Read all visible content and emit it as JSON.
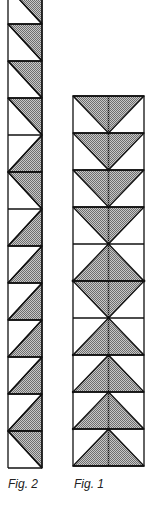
{
  "figures": {
    "fig2": {
      "caption": "Fig. 2",
      "description": "Single column strip of half-square triangle blocks (diagonal splits), partially cropped at top",
      "rows_top_to_bottom": [
        "diag-tl-br shaded-upper-right (cropped)",
        "diag-tl-br shaded-upper-right",
        "diag-tl-br shaded-upper-right",
        "diag-tl-br shaded-upper-right",
        "diag-tr-bl shaded-lower-right",
        "diag-tl-br shaded-upper-right",
        "diag-tr-bl shaded-lower-right",
        "diag-tr-bl shaded-lower-right",
        "diag-tr-bl shaded-lower-right",
        "diag-tr-bl shaded-lower-right",
        "diag-tr-bl shaded-lower-right",
        "diag-tr-bl shaded-lower-right",
        "diag-tl-br shaded-upper-right"
      ]
    },
    "fig1": {
      "caption": "Fig. 1",
      "description": "Column of flying-geese blocks: 4 pointing down, diamond in the middle, 4 pointing up",
      "rows_top_to_bottom": [
        "triangle-down",
        "triangle-down",
        "triangle-down",
        "triangle-down",
        "triangle-up",
        "triangle-down",
        "triangle-up",
        "triangle-up",
        "triangle-up",
        "triangle-up"
      ]
    }
  },
  "colors": {
    "line": "#111111",
    "shade_dark": "#6e6e6e",
    "shade_light": "#c8c8c8",
    "background": "#ffffff"
  }
}
